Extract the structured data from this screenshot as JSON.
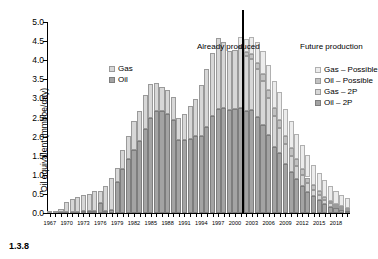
{
  "figure": {
    "number": "1.3.8"
  },
  "chart_data": {
    "type": "bar",
    "title": "",
    "xlabel": "",
    "ylabel": "Oil equivalent (mmboe/day)",
    "ylim": [
      0.0,
      5.0
    ],
    "ytick_step": 0.5,
    "ytick_labels": [
      "0.0",
      "0.5",
      "1.0",
      "1.5",
      "2.0",
      "2.5",
      "3.0",
      "3.5",
      "4.0",
      "4.5",
      "5.0"
    ],
    "grid": false,
    "stacked": true,
    "legend_position": "inside-left and inside-right",
    "xtick_labels": [
      "1967",
      "1970",
      "1973",
      "1976",
      "1979",
      "1982",
      "1985",
      "1988",
      "1991",
      "1994",
      "1997",
      "2000",
      "2003",
      "2006",
      "2009",
      "2012",
      "2015",
      "2018"
    ],
    "xtick_step": 3,
    "x": [
      1967,
      1968,
      1969,
      1970,
      1971,
      1972,
      1973,
      1974,
      1975,
      1976,
      1977,
      1978,
      1979,
      1980,
      1981,
      1982,
      1983,
      1984,
      1985,
      1986,
      1987,
      1988,
      1989,
      1990,
      1991,
      1992,
      1993,
      1994,
      1995,
      1996,
      1997,
      1998,
      1999,
      2000,
      2001,
      2002,
      2003,
      2004,
      2005,
      2006,
      2007,
      2008,
      2009,
      2010,
      2011,
      2012,
      2013,
      2014,
      2015,
      2016,
      2017,
      2018,
      2019,
      2020
    ],
    "divider_year": 2001.5,
    "annotations": [
      {
        "text": "Already produced",
        "x_year": 1996,
        "y": 4.85
      },
      {
        "text": "Future production",
        "x_year": 2009,
        "y": 4.85
      }
    ],
    "series": [
      {
        "name": "Oil – 2P",
        "color": "#a3a3a3",
        "values": [
          0.0,
          0.01,
          0.02,
          0.02,
          0.03,
          0.03,
          0.04,
          0.04,
          0.05,
          0.27,
          0.05,
          0.08,
          0.82,
          1.14,
          1.42,
          1.66,
          1.89,
          2.19,
          2.5,
          2.68,
          2.68,
          2.6,
          2.43,
          1.92,
          1.92,
          1.95,
          2.02,
          2.02,
          2.26,
          2.55,
          2.72,
          2.74,
          2.7,
          2.72,
          2.74,
          2.68,
          2.69,
          2.51,
          2.31,
          2.03,
          1.72,
          1.56,
          1.28,
          1.08,
          0.88,
          0.72,
          0.56,
          0.44,
          0.33,
          0.24,
          0.17,
          0.12,
          0.08,
          0.05
        ]
      },
      {
        "name": "Gas – 2P",
        "color": "#d7d7d7",
        "values": [
          0.02,
          0.05,
          0.09,
          0.28,
          0.33,
          0.38,
          0.42,
          0.46,
          0.52,
          0.3,
          0.66,
          0.84,
          0.35,
          0.52,
          0.6,
          0.74,
          0.79,
          0.9,
          0.89,
          0.72,
          0.63,
          0.63,
          0.61,
          0.56,
          0.66,
          0.84,
          0.97,
          1.33,
          1.52,
          1.65,
          1.85,
          1.75,
          1.55,
          1.54,
          1.58,
          1.44,
          1.34,
          1.26,
          1.15,
          0.98,
          0.82,
          0.66,
          0.52,
          0.42,
          0.34,
          0.27,
          0.22,
          0.17,
          0.13,
          0.1,
          0.08,
          0.06,
          0.05,
          0.04
        ]
      },
      {
        "name": "Oil – Possible",
        "color": "#c2c2c2",
        "values": [
          0,
          0,
          0,
          0,
          0,
          0,
          0,
          0,
          0,
          0,
          0,
          0,
          0,
          0,
          0,
          0,
          0,
          0,
          0,
          0,
          0,
          0,
          0,
          0,
          0,
          0,
          0,
          0,
          0,
          0,
          0,
          0,
          0,
          0,
          0.06,
          0.1,
          0.14,
          0.17,
          0.19,
          0.21,
          0.22,
          0.22,
          0.21,
          0.2,
          0.19,
          0.17,
          0.15,
          0.13,
          0.11,
          0.09,
          0.07,
          0.06,
          0.05,
          0.04
        ]
      },
      {
        "name": "Gas – Possible",
        "color": "#ececec",
        "values": [
          0,
          0,
          0,
          0,
          0,
          0,
          0,
          0,
          0,
          0,
          0,
          0,
          0,
          0,
          0,
          0,
          0,
          0,
          0,
          0,
          0,
          0,
          0,
          0,
          0,
          0,
          0,
          0,
          0,
          0,
          0,
          0,
          0,
          0,
          0.24,
          0.34,
          0.44,
          0.53,
          0.6,
          0.66,
          0.7,
          0.72,
          0.72,
          0.7,
          0.67,
          0.63,
          0.58,
          0.53,
          0.48,
          0.43,
          0.38,
          0.34,
          0.3,
          0.27
        ]
      }
    ]
  },
  "legend_left": {
    "items": [
      {
        "label": "Gas",
        "swatch": "gas"
      },
      {
        "label": "Oil",
        "swatch": "oil"
      }
    ]
  },
  "legend_right": {
    "items": [
      {
        "label": "Gas – Possible",
        "swatch": "gaspos"
      },
      {
        "label": "Oil – Possible",
        "swatch": "oilpos"
      },
      {
        "label": "Gas – 2P",
        "swatch": "gas"
      },
      {
        "label": "Oil – 2P",
        "swatch": "oil"
      }
    ]
  }
}
